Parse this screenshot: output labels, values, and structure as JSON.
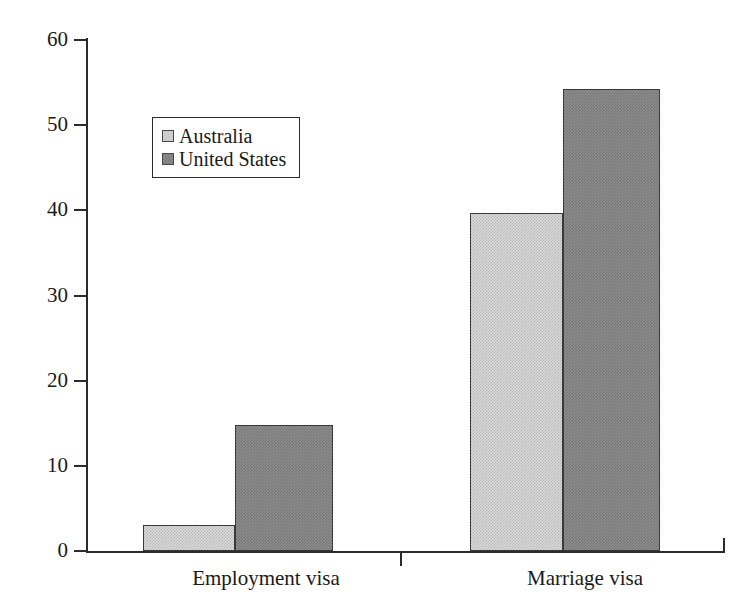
{
  "chart_data": {
    "type": "bar",
    "title": "",
    "subtitle": "",
    "xlabel": "",
    "ylabel": "",
    "categories": [
      "Employment visa",
      "Marriage visa"
    ],
    "series": [
      {
        "name": "Australia",
        "color": "#d9d9d9",
        "values": [
          3.1,
          39.7
        ]
      },
      {
        "name": "United States",
        "color": "#8e8e8e",
        "values": [
          14.8,
          54.2
        ]
      }
    ],
    "ylim": [
      0,
      60
    ],
    "y_ticks": [
      0,
      10,
      20,
      30,
      40,
      50,
      60
    ],
    "y_tick_labels": [
      "0",
      "10",
      "20",
      "30",
      "40",
      "50",
      "60"
    ],
    "grid": false,
    "legend_position": "upper-left-inside",
    "legend_entries": [
      "Australia",
      "United States"
    ],
    "annotations": []
  },
  "axes": {
    "y_tick_labels": [
      "60",
      "50",
      "40",
      "30",
      "20",
      "10",
      "0"
    ]
  },
  "legend": {
    "items": [
      {
        "label": "Australia"
      },
      {
        "label": "United States"
      }
    ]
  },
  "categories": [
    {
      "label": "Employment visa"
    },
    {
      "label": "Marriage visa"
    }
  ],
  "bars": [
    {
      "name": "employment-visa-australia",
      "value": "3.1"
    },
    {
      "name": "employment-visa-united-states",
      "value": "14.8"
    },
    {
      "name": "marriage-visa-australia",
      "value": "39.7"
    },
    {
      "name": "marriage-visa-united-states",
      "value": "54.2"
    }
  ]
}
